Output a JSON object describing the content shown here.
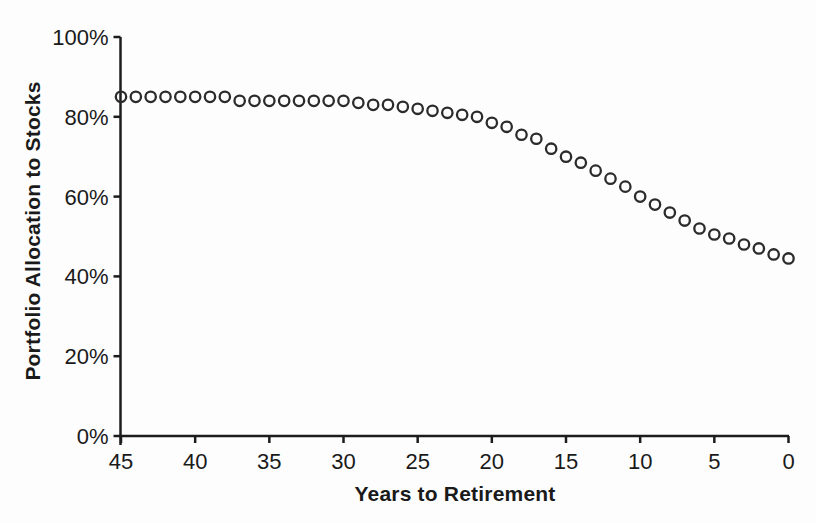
{
  "page": {
    "background_color": "#fdfdfd",
    "text_color": "#1a1a1a"
  },
  "chart_data": {
    "type": "scatter",
    "title": "",
    "xlabel": "Years to Retirement",
    "ylabel": "Portfolio Allocation to Stocks",
    "x_axis_reversed": true,
    "xlim": [
      45,
      0
    ],
    "ylim": [
      0,
      100
    ],
    "grid": false,
    "legend_position": "none",
    "x_ticks": [
      45,
      40,
      35,
      30,
      25,
      20,
      15,
      10,
      5,
      0
    ],
    "y_ticks": [
      0,
      20,
      40,
      60,
      80,
      100
    ],
    "y_tick_suffix": "%",
    "x": [
      45,
      44,
      43,
      42,
      41,
      40,
      39,
      38,
      37,
      36,
      35,
      34,
      33,
      32,
      31,
      30,
      29,
      28,
      27,
      26,
      25,
      24,
      23,
      22,
      21,
      20,
      19,
      18,
      17,
      16,
      15,
      14,
      13,
      12,
      11,
      10,
      9,
      8,
      7,
      6,
      5,
      4,
      3,
      2,
      1,
      0
    ],
    "y": [
      85,
      85,
      85,
      85,
      85,
      85,
      85,
      85,
      84,
      84,
      84,
      84,
      84,
      84,
      84,
      84,
      83.5,
      83,
      83,
      82.5,
      82,
      81.5,
      81,
      80.5,
      80,
      78.5,
      77.5,
      75.5,
      74.5,
      72,
      70,
      68.5,
      66.5,
      64.5,
      62.5,
      60,
      58,
      56,
      54,
      52,
      50.5,
      49.5,
      48,
      47,
      45.5,
      44.5
    ],
    "marker": {
      "shape": "open-circle",
      "stroke_color": "#2b2b2b",
      "fill": "none",
      "radius_px": 5.2,
      "stroke_width_px": 2.3
    },
    "axis_color": "#1c1c1c",
    "axis_stroke_width_px": 2.5,
    "tick_length_px": 7
  }
}
